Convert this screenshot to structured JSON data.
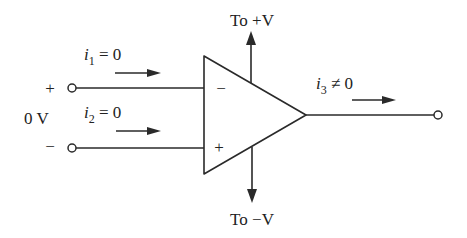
{
  "diagram": {
    "supply": {
      "top_label": "To +V",
      "bottom_label": "To −V"
    },
    "inputs": {
      "node_plus_sign": "+",
      "node_minus_sign": "−",
      "voltage_label": "0 V",
      "i1": {
        "symbol": "i",
        "subscript": "1",
        "relation": " = 0"
      },
      "i2": {
        "symbol": "i",
        "subscript": "2",
        "relation": " = 0"
      }
    },
    "opamp": {
      "inverting_sign": "−",
      "noninverting_sign": "+"
    },
    "output": {
      "i3": {
        "symbol": "i",
        "subscript": "3",
        "relation": " ≠ 0"
      }
    },
    "colors": {
      "line": "#2a2a2a",
      "background": "#ffffff"
    }
  }
}
